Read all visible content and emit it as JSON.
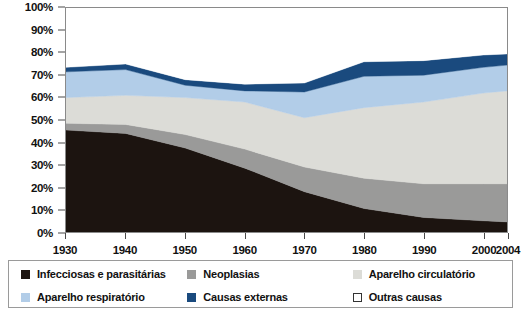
{
  "chart_data": {
    "type": "area",
    "title": "",
    "subtitle": "",
    "xlabel": "",
    "ylabel": "",
    "stacked": true,
    "grid": false,
    "legend_position": "bottom",
    "xlim": [
      1930,
      2004
    ],
    "ylim": [
      0,
      100
    ],
    "x": [
      1930,
      1940,
      1950,
      1960,
      1970,
      1980,
      1990,
      2000,
      2004
    ],
    "xtick_labels": [
      "1930",
      "1940",
      "1950",
      "1960",
      "1970",
      "1980",
      "1990",
      "2000",
      "2004"
    ],
    "ytick_labels": [
      "0%",
      "10%",
      "20%",
      "30%",
      "40%",
      "50%",
      "60%",
      "70%",
      "80%",
      "90%",
      "100%"
    ],
    "ytick_values": [
      0,
      10,
      20,
      30,
      40,
      50,
      60,
      70,
      80,
      90,
      100
    ],
    "series": [
      {
        "name": "Infecciosas e parasitárias",
        "color": "#1c1410",
        "values": [
          45.5,
          44.0,
          37.5,
          28.5,
          18.0,
          10.5,
          6.5,
          5.0,
          4.5
        ]
      },
      {
        "name": "Neoplasias",
        "color": "#9a9a99",
        "values": [
          3.0,
          4.0,
          6.0,
          8.5,
          11.0,
          13.5,
          15.0,
          16.5,
          17.0
        ]
      },
      {
        "name": "Aparelho circulatório",
        "color": "#dcdcd7",
        "values": [
          11.5,
          13.0,
          16.5,
          21.0,
          22.0,
          31.5,
          36.5,
          40.5,
          41.5
        ]
      },
      {
        "name": "Aparelho respiratório",
        "color": "#b2cde8",
        "values": [
          11.5,
          11.5,
          5.5,
          5.0,
          11.5,
          14.0,
          12.0,
          11.5,
          11.5
        ]
      },
      {
        "name": "Causas externas",
        "color": "#1a4a7e",
        "values": [
          2.0,
          2.5,
          2.5,
          3.0,
          4.0,
          6.5,
          6.5,
          5.5,
          5.0
        ]
      },
      {
        "name": "Outras causas",
        "color": "#ffffff",
        "values": [
          26.5,
          25.0,
          32.0,
          34.0,
          33.5,
          24.0,
          23.5,
          21.0,
          20.5
        ]
      }
    ]
  },
  "legend": {
    "items": [
      {
        "label": "Infecciosas e parasitárias",
        "color": "#1c1410",
        "outlined": false
      },
      {
        "label": "Neoplasias",
        "color": "#9a9a99",
        "outlined": false
      },
      {
        "label": "Aparelho circulatório",
        "color": "#dcdcd7",
        "outlined": false
      },
      {
        "label": "Aparelho respiratório",
        "color": "#b2cde8",
        "outlined": false
      },
      {
        "label": "Causas externas",
        "color": "#1a4a7e",
        "outlined": false
      },
      {
        "label": "Outras causas",
        "color": "#ffffff",
        "outlined": true
      }
    ]
  },
  "footer": {
    "caption": ""
  }
}
